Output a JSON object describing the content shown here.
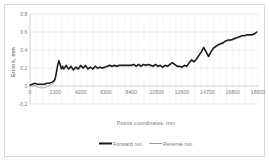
{
  "chart_data": {
    "type": "line",
    "title": "",
    "xlabel": "Points coordinates, mm",
    "ylabel": "Errors, mm",
    "xlim": [
      0,
      18900
    ],
    "ylim": [
      -0.2,
      0.8
    ],
    "xticks": [
      0,
      2100,
      4200,
      6300,
      8400,
      10500,
      12600,
      14700,
      16800,
      18900
    ],
    "xtick_labels": [
      "0",
      "2100",
      "4200",
      "6300",
      "8400",
      "10500",
      "12600",
      "14700",
      "16800",
      "18900"
    ],
    "yticks": [
      -0.2,
      0,
      0.2,
      0.4,
      0.6,
      0.8
    ],
    "ytick_labels": [
      "-0.2",
      "0",
      "0.2",
      "0.4",
      "0.6",
      "0.8"
    ],
    "grid": {
      "horizontal": true,
      "vertical": true
    },
    "legend": {
      "position": "bottom",
      "entries": [
        "Forward run",
        "Reverse run"
      ]
    },
    "colors": {
      "forward": "#1a1a1a",
      "reverse": "#9a9a9a",
      "grid": "#d9d9d9",
      "text": "#808080"
    },
    "x": [
      0,
      200,
      400,
      600,
      800,
      1000,
      1200,
      1400,
      1600,
      1800,
      2000,
      2100,
      2200,
      2300,
      2400,
      2500,
      2600,
      2700,
      2800,
      3000,
      3200,
      3400,
      3600,
      3800,
      4000,
      4200,
      4400,
      4600,
      4800,
      5000,
      5200,
      5400,
      5600,
      5800,
      6000,
      6200,
      6400,
      6600,
      6800,
      7000,
      7200,
      7400,
      7600,
      7800,
      8000,
      8200,
      8400,
      8600,
      8800,
      9000,
      9200,
      9400,
      9600,
      9800,
      10000,
      10200,
      10400,
      10600,
      10800,
      11000,
      11200,
      11400,
      11600,
      11800,
      12000,
      12200,
      12400,
      12600,
      12800,
      13000,
      13200,
      13400,
      13600,
      13800,
      14000,
      14200,
      14400,
      14600,
      14800,
      15000,
      15200,
      15400,
      15600,
      15800,
      16000,
      16200,
      16400,
      16600,
      16800,
      17000,
      17200,
      17400,
      17600,
      17800,
      18000,
      18200,
      18400,
      18600,
      18800
    ],
    "series": [
      {
        "name": "Forward run",
        "values": [
          0.01,
          0.02,
          0.03,
          0.02,
          0.02,
          0.02,
          0.02,
          0.03,
          0.03,
          0.04,
          0.06,
          0.09,
          0.16,
          0.24,
          0.28,
          0.24,
          0.19,
          0.22,
          0.19,
          0.23,
          0.19,
          0.22,
          0.18,
          0.21,
          0.19,
          0.23,
          0.2,
          0.23,
          0.19,
          0.21,
          0.19,
          0.22,
          0.2,
          0.21,
          0.2,
          0.21,
          0.22,
          0.23,
          0.22,
          0.23,
          0.22,
          0.23,
          0.23,
          0.23,
          0.23,
          0.23,
          0.23,
          0.24,
          0.22,
          0.24,
          0.22,
          0.24,
          0.23,
          0.24,
          0.23,
          0.22,
          0.24,
          0.22,
          0.23,
          0.21,
          0.23,
          0.22,
          0.24,
          0.26,
          0.24,
          0.22,
          0.22,
          0.21,
          0.23,
          0.22,
          0.26,
          0.29,
          0.27,
          0.3,
          0.34,
          0.38,
          0.43,
          0.38,
          0.33,
          0.38,
          0.42,
          0.44,
          0.46,
          0.47,
          0.48,
          0.5,
          0.51,
          0.51,
          0.52,
          0.53,
          0.54,
          0.55,
          0.56,
          0.56,
          0.57,
          0.57,
          0.57,
          0.58,
          0.6
        ]
      },
      {
        "name": "Reverse run",
        "values": [
          0.0,
          0.0,
          0.0,
          -0.01,
          -0.02,
          -0.02,
          -0.02,
          -0.01,
          0.0,
          0.02,
          0.04,
          0.07,
          0.14,
          0.22,
          0.26,
          0.22,
          0.18,
          0.2,
          0.18,
          0.21,
          0.18,
          0.2,
          0.17,
          0.19,
          0.18,
          0.21,
          0.19,
          0.21,
          0.18,
          0.2,
          0.18,
          0.2,
          0.19,
          0.2,
          0.19,
          0.2,
          0.21,
          0.22,
          0.21,
          0.22,
          0.21,
          0.22,
          0.22,
          0.22,
          0.22,
          0.22,
          0.22,
          0.23,
          0.21,
          0.23,
          0.21,
          0.23,
          0.22,
          0.23,
          0.22,
          0.21,
          0.23,
          0.21,
          0.22,
          0.2,
          0.22,
          0.21,
          0.23,
          0.25,
          0.23,
          0.21,
          0.21,
          0.2,
          0.22,
          0.21,
          0.25,
          0.28,
          0.26,
          0.29,
          0.33,
          0.37,
          0.42,
          0.37,
          0.32,
          0.37,
          0.41,
          0.43,
          0.45,
          0.46,
          0.47,
          0.49,
          0.5,
          0.5,
          0.51,
          0.52,
          0.53,
          0.54,
          0.55,
          0.55,
          0.56,
          0.56,
          0.56,
          0.57,
          0.59
        ]
      }
    ]
  }
}
